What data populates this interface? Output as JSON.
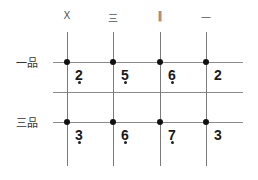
{
  "columns": [
    {
      "label": "X",
      "x": 67
    },
    {
      "label": "三",
      "x": 113
    },
    {
      "label": "‖",
      "x": 160
    },
    {
      "label": "一",
      "x": 206
    }
  ],
  "rows": [
    {
      "label": "一品",
      "y": 62,
      "cells": [
        {
          "value": "2",
          "dot": true
        },
        {
          "value": "5",
          "dot": true
        },
        {
          "value": "6",
          "dot": true
        },
        {
          "value": "2",
          "dot": false
        }
      ]
    },
    {
      "label": "三品",
      "y": 122,
      "cells": [
        {
          "value": "3",
          "dot": true
        },
        {
          "value": "6",
          "dot": true
        },
        {
          "value": "7",
          "dot": true
        },
        {
          "value": "3",
          "dot": false
        }
      ]
    }
  ],
  "middle_line_y": 92,
  "colors": {
    "grid": "#8a8a8a",
    "node": "#111111",
    "text": "#1a1a1a"
  }
}
